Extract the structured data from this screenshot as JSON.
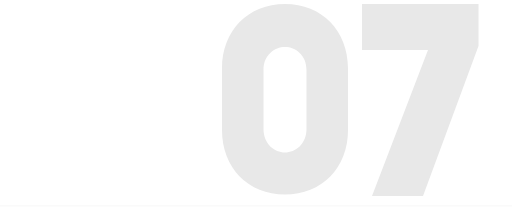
{
  "page": {
    "background_color": "#FFFFFF",
    "width": 512,
    "height": 217
  },
  "numeral": {
    "value": "07",
    "digits": [
      "0",
      "7"
    ],
    "fill_color": "#E8E8E8",
    "role_label": "section-number",
    "alignment": "right",
    "cropped_at_right_edge": true,
    "style": "heavy-condensed-grotesque"
  },
  "divider": {
    "color": "#FAFAFA",
    "label": "bottom-hairline"
  },
  "a11y": {
    "numeral_description": "07"
  }
}
